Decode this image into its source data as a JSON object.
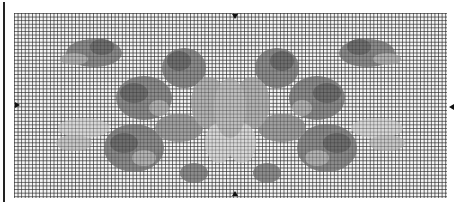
{
  "pattern": {
    "type": "cross-stitch chart",
    "motif": "symmetric floral spray",
    "colors": {
      "grid_background": "#f4f4f4",
      "grid_lines": "#3c3c3c",
      "dark": "#6e6e6e",
      "mid": "#8c8c8c",
      "light": "#b4b4b4",
      "pale": "#d8d8d8",
      "marker": "#111111"
    },
    "center_markers": [
      "top",
      "bottom",
      "left",
      "right"
    ]
  }
}
